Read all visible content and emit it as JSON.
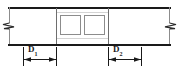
{
  "diagram": {
    "type": "engineering-section-drawing",
    "colors": {
      "outline": "#1a1a1a",
      "thin_line": "#8c8c8c",
      "background": "#ffffff",
      "dimension_line": "#1a1a1a"
    },
    "edges": {
      "top_edge": {
        "y": 7,
        "x1": 8,
        "x2": 171,
        "thickness": 2
      },
      "bottom_edge": {
        "y": 44,
        "x1": 8,
        "x2": 171,
        "thickness": 2
      }
    },
    "break_symbols": [
      {
        "name": "left-break",
        "x": 9,
        "y_top": 7,
        "y_bottom": 44
      },
      {
        "name": "right-break",
        "x": 170,
        "y_top": 7,
        "y_bottom": 44
      }
    ],
    "dividers": [
      {
        "name": "left-divider",
        "x": 56,
        "y1": 7,
        "y2": 44
      },
      {
        "name": "right-divider",
        "x": 108,
        "y1": 7,
        "y2": 44
      }
    ],
    "openings": [
      {
        "name": "opening-1",
        "x": 60,
        "y": 15,
        "width": 20,
        "height": 20,
        "shape": "square"
      },
      {
        "name": "opening-2",
        "x": 84,
        "y": 15,
        "width": 20,
        "height": 20,
        "shape": "square"
      }
    ],
    "dimensions": [
      {
        "id": "d1",
        "label": "D",
        "subscript": "1",
        "x_start": 23,
        "x_end": 56,
        "y": 60,
        "extension_top": 46,
        "extension_bottom": 66,
        "arrow_style": "filled-inward"
      },
      {
        "id": "d2",
        "label": "D",
        "subscript": "2",
        "x_start": 108,
        "x_end": 141,
        "y": 60,
        "extension_top": 46,
        "extension_bottom": 66,
        "arrow_style": "filled-inward"
      }
    ]
  }
}
